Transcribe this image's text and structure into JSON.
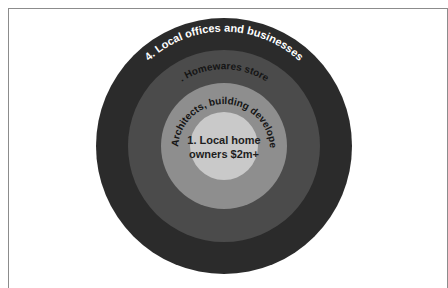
{
  "diagram": {
    "type": "concentric-circles",
    "colors": {
      "ring4": "#2b2b2b",
      "ring3": "#4b4b4b",
      "ring2": "#8e8e8e",
      "ring1": "#c9c9c9",
      "ring4_text": "#ffffff",
      "ring3_text": "#151515",
      "ring2_text": "#151515",
      "ring1_text": "#1e1e1e"
    },
    "rings": [
      {
        "level": 1,
        "label_line1": "1. Local home",
        "label_line2": "owners $2m+"
      },
      {
        "level": 2,
        "label": "2. Architects, building developers"
      },
      {
        "level": 3,
        "label": "3. Homewares stores"
      },
      {
        "level": 4,
        "label": "4. Local offices and businesses"
      }
    ]
  }
}
